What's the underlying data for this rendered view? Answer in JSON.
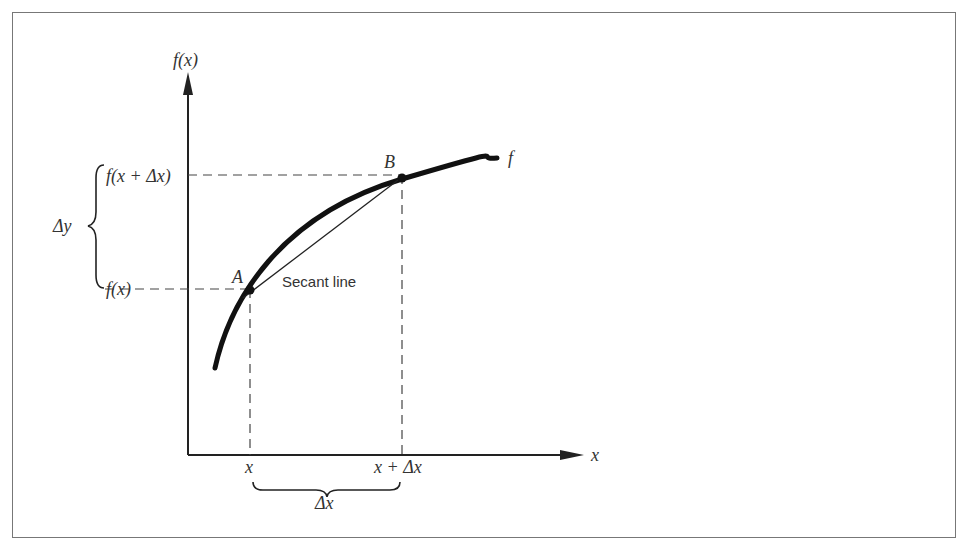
{
  "diagram": {
    "y_axis_label": "f(x)",
    "x_axis_label": "x",
    "curve_label": "f",
    "point_a_label": "A",
    "point_b_label": "B",
    "secant_label": "Secant line",
    "y_tick_upper": "f(x + Δx)",
    "y_tick_lower": "f(x)",
    "x_tick_left": "x",
    "x_tick_right": "x + Δx",
    "delta_y_label": "Δy",
    "delta_x_label": "Δx"
  },
  "colors": {
    "ink": "#222222",
    "frame": "#777777"
  }
}
